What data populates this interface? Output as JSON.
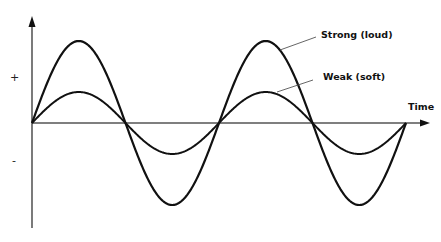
{
  "labels": {
    "strong": "Strong (loud)",
    "weak": "Weak (soft)",
    "x_axis": "Time",
    "plus": "+",
    "minus": "-"
  },
  "chart_data": {
    "type": "line",
    "title": "",
    "xlabel": "Time",
    "ylabel": "",
    "y_tick_labels": [
      "+",
      "-"
    ],
    "cycles": 2,
    "grid": false,
    "series": [
      {
        "name": "Strong (loud)",
        "amplitude_relative": 1.0,
        "amplitude_px": 82
      },
      {
        "name": "Weak (soft)",
        "amplitude_relative": 0.38,
        "amplitude_px": 31
      }
    ],
    "zero_crossings_px": [
      32,
      124,
      218,
      313,
      406
    ]
  },
  "colors": {
    "line": "#111111",
    "axis": "#333333",
    "leader": "#555555"
  }
}
